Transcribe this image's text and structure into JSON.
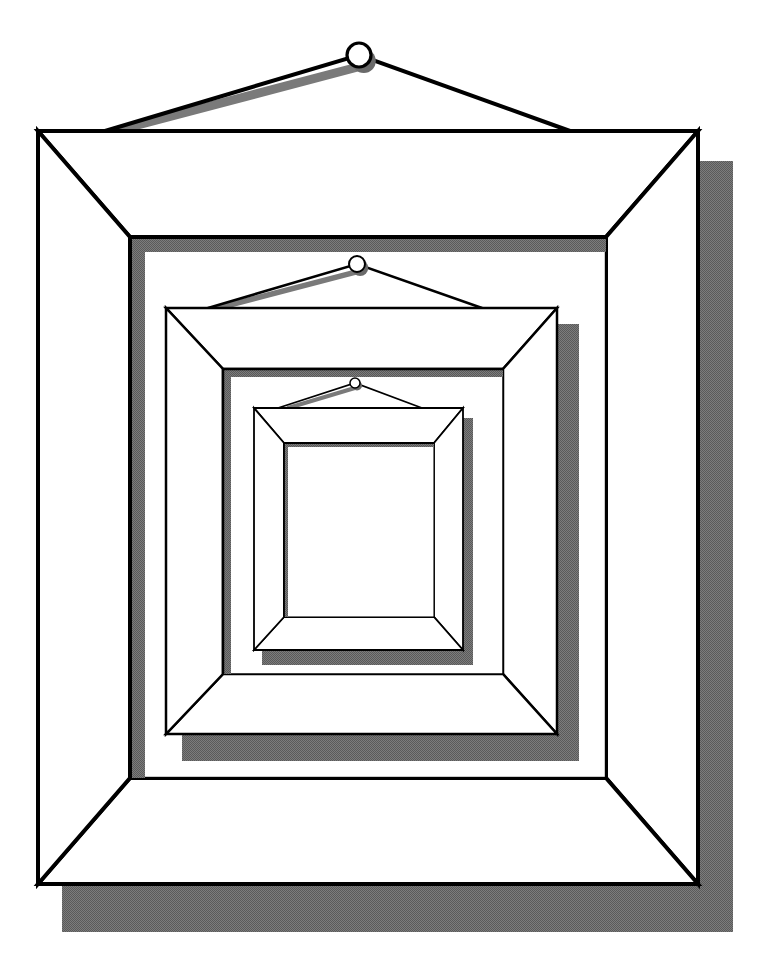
{
  "illustration": {
    "title": "Nested picture frames",
    "description": "Three hanging picture frames, each nested inside the opening of the previous one, with drop shadows",
    "canvas": {
      "width": 768,
      "height": 975,
      "background": "#ffffff"
    },
    "colors": {
      "line": "#000000",
      "fill": "#ffffff",
      "shadow": "#6a6a6a",
      "shadow_light": "#8a8a8a"
    },
    "frames": [
      {
        "name": "outer-frame",
        "outer": {
          "x1": 38,
          "y1": 131,
          "x2": 698,
          "y2": 884
        },
        "inner": {
          "x1": 130,
          "y1": 237,
          "x2": 606,
          "y2": 778
        },
        "stroke": 4,
        "drop_shadow": {
          "x1": 62,
          "y1": 161,
          "x2": 733,
          "y2": 932
        },
        "inner_shadow": 15,
        "nail": {
          "cx": 359,
          "cy": 55,
          "r": 12
        },
        "string": {
          "left_x": 105,
          "right_x": 570
        }
      },
      {
        "name": "middle-frame",
        "outer": {
          "x1": 166,
          "y1": 308,
          "x2": 557,
          "y2": 734
        },
        "inner": {
          "x1": 223,
          "y1": 369,
          "x2": 503,
          "y2": 674
        },
        "stroke": 2.5,
        "drop_shadow": {
          "x1": 182,
          "y1": 324,
          "x2": 579,
          "y2": 761
        },
        "inner_shadow": 8,
        "nail": {
          "cx": 357,
          "cy": 264,
          "r": 8
        },
        "string": {
          "left_x": 208,
          "right_x": 482
        }
      },
      {
        "name": "inner-frame",
        "outer": {
          "x1": 254,
          "y1": 408,
          "x2": 463,
          "y2": 650
        },
        "inner": {
          "x1": 284,
          "y1": 443,
          "x2": 434,
          "y2": 617
        },
        "stroke": 1.8,
        "drop_shadow": {
          "x1": 262,
          "y1": 418,
          "x2": 473,
          "y2": 665
        },
        "inner_shadow": 4,
        "nail": {
          "cx": 355,
          "cy": 383,
          "r": 5
        },
        "string": {
          "left_x": 278,
          "right_x": 422
        }
      }
    ]
  }
}
